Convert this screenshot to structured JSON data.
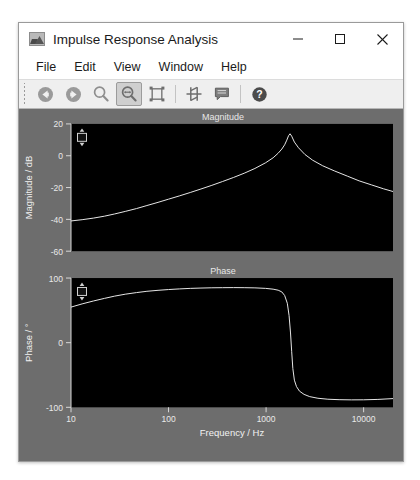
{
  "window": {
    "title": "Impulse Response Analysis",
    "icon": "image-chart-icon",
    "controls": {
      "minimize": "—",
      "maximize": "☐",
      "close": "✕"
    }
  },
  "menubar": {
    "items": [
      {
        "label": "File"
      },
      {
        "label": "Edit"
      },
      {
        "label": "View"
      },
      {
        "label": "Window"
      },
      {
        "label": "Help"
      }
    ]
  },
  "toolbar": {
    "buttons": [
      {
        "name": "back-icon",
        "tooltip": "Back",
        "selected": false
      },
      {
        "name": "forward-icon",
        "tooltip": "Forward",
        "selected": false
      },
      {
        "name": "zoom-icon",
        "tooltip": "Zoom",
        "selected": false
      },
      {
        "name": "pan-zoom-icon",
        "tooltip": "Pan / Zoom",
        "selected": true
      },
      {
        "name": "fit-bounds-icon",
        "tooltip": "Fit Bounds",
        "selected": false
      },
      {
        "name": "cursor-tool-icon",
        "tooltip": "Cursor",
        "selected": false
      },
      {
        "name": "annotate-icon",
        "tooltip": "Annotate",
        "selected": false
      },
      {
        "name": "help-icon",
        "tooltip": "Help",
        "selected": false
      }
    ]
  },
  "colors": {
    "panel_bg": "#6d6d6d",
    "plot_bg": "#000000",
    "trace": "#e6e6e6",
    "tick_text": "#e9e9e9",
    "toolbar_bg": "#efefef",
    "selected_btn": "#cfcfcf"
  },
  "chart_data": [
    {
      "type": "line",
      "id": "magnitude",
      "title": "Magnitude",
      "xlabel": "",
      "ylabel": "Magnitude / dB",
      "xscale": "log",
      "xlim": [
        10,
        20000
      ],
      "ylim": [
        -60,
        20
      ],
      "xticks": [
        10,
        100,
        1000,
        10000
      ],
      "xticklabels": [
        "10",
        "100",
        "1000",
        "10000"
      ],
      "yticks": [
        20,
        0,
        -20,
        -40,
        -60
      ],
      "yticklabels": [
        "20",
        "0",
        "-20",
        "-40",
        "-60"
      ],
      "grid": false,
      "legend": "none",
      "cursor_handle": {
        "visible": true,
        "x_frac": 0.025,
        "y_frac": 0.09
      },
      "series": [
        {
          "name": "magnitude",
          "x": [
            10,
            13,
            17,
            22,
            28,
            36,
            47,
            60,
            78,
            100,
            130,
            167,
            215,
            278,
            358,
            462,
            596,
            768,
            990,
            1180,
            1330,
            1450,
            1550,
            1630,
            1700,
            1760,
            1830,
            1950,
            2150,
            2500,
            3000,
            3800,
            5000,
            6800,
            9000,
            12000,
            16000,
            20000
          ],
          "y": [
            -41.0,
            -40.2,
            -39.2,
            -38.0,
            -36.6,
            -35.0,
            -33.2,
            -31.3,
            -29.3,
            -27.3,
            -25.2,
            -23.1,
            -20.9,
            -18.6,
            -16.2,
            -13.7,
            -11.0,
            -8.0,
            -4.4,
            -1.3,
            1.6,
            4.2,
            6.9,
            9.8,
            12.6,
            13.8,
            12.3,
            8.6,
            5.0,
            0.8,
            -2.8,
            -6.3,
            -9.5,
            -12.8,
            -15.8,
            -18.3,
            -20.8,
            -22.5
          ]
        }
      ]
    },
    {
      "type": "line",
      "id": "phase",
      "title": "Phase",
      "xlabel": "Frequency / Hz",
      "ylabel": "Phase / °",
      "xscale": "log",
      "xlim": [
        10,
        20000
      ],
      "ylim": [
        -100,
        100
      ],
      "xticks": [
        10,
        100,
        1000,
        10000
      ],
      "xticklabels": [
        "10",
        "100",
        "1000",
        "10000"
      ],
      "yticks": [
        100,
        0,
        -100
      ],
      "yticklabels": [
        "100",
        "0",
        "-100"
      ],
      "grid": false,
      "legend": "none",
      "cursor_handle": {
        "visible": true,
        "x_frac": 0.025,
        "y_frac": 0.09
      },
      "series": [
        {
          "name": "phase",
          "x": [
            10,
            13,
            17,
            22,
            28,
            36,
            47,
            60,
            78,
            100,
            130,
            167,
            215,
            278,
            358,
            462,
            596,
            768,
            990,
            1180,
            1330,
            1450,
            1550,
            1650,
            1720,
            1780,
            1830,
            1880,
            1950,
            2050,
            2200,
            2450,
            2800,
            3400,
            4300,
            5600,
            7500,
            10000,
            14000,
            20000
          ],
          "y": [
            55.0,
            60.0,
            64.5,
            68.5,
            72.0,
            75.0,
            77.5,
            79.5,
            81.0,
            82.2,
            83.2,
            84.0,
            84.5,
            84.9,
            85.1,
            85.2,
            85.1,
            84.8,
            84.0,
            82.8,
            81.2,
            78.5,
            73.0,
            61.0,
            42.0,
            15.0,
            -14.0,
            -40.0,
            -58.0,
            -68.0,
            -75.0,
            -80.0,
            -83.5,
            -86.0,
            -87.5,
            -88.2,
            -88.5,
            -88.4,
            -87.8,
            -86.5
          ]
        }
      ]
    }
  ]
}
